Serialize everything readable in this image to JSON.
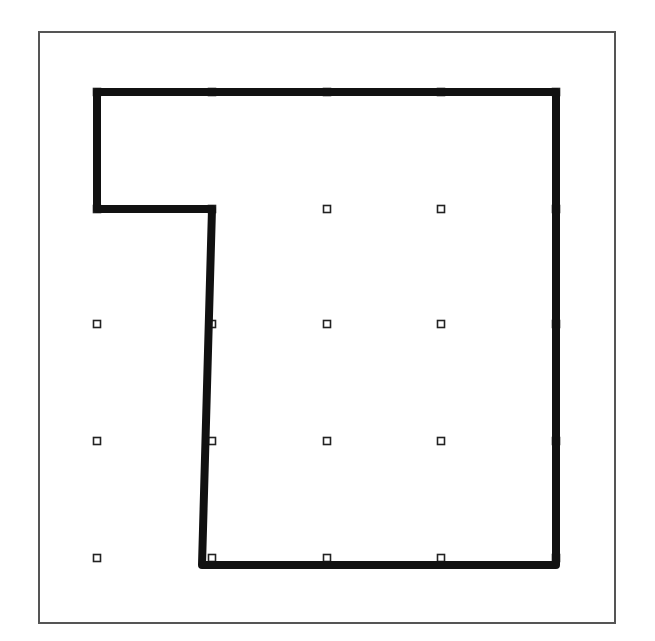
{
  "figure": {
    "type": "dot-grid-polygon",
    "frame": {
      "x": 39,
      "y": 32,
      "width": 576,
      "height": 591,
      "stroke": "#555555"
    },
    "grid": {
      "columns": [
        97,
        212,
        327,
        441,
        556
      ],
      "rows": [
        92,
        209,
        324,
        441,
        558
      ],
      "dot_size": 7,
      "dot_color": "#222222"
    },
    "polygon": {
      "points": [
        [
          97,
          92
        ],
        [
          556,
          92
        ],
        [
          556,
          565
        ],
        [
          202,
          565
        ],
        [
          212,
          209
        ],
        [
          97,
          209
        ]
      ],
      "stroke": "#111111",
      "stroke_width": 8
    }
  }
}
